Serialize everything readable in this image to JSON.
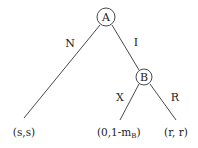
{
  "diagram": {
    "type": "game-tree",
    "nodes": [
      {
        "id": "A",
        "label": "A",
        "cx": 106,
        "cy": 18,
        "r": 9
      },
      {
        "id": "B",
        "label": "B",
        "cx": 144,
        "cy": 77,
        "r": 8
      }
    ],
    "edges": [
      {
        "from": "A",
        "label": "N",
        "to": "leaf-ss"
      },
      {
        "from": "A",
        "label": "I",
        "to": "B"
      },
      {
        "from": "B",
        "label": "X",
        "to": "leaf-0-1mb"
      },
      {
        "from": "B",
        "label": "R",
        "to": "leaf-rr"
      }
    ],
    "edge_labels": {
      "N": "N",
      "I": "I",
      "X": "X",
      "R": "R"
    },
    "payoffs": {
      "ss": "(s,s)",
      "zero_one_minus_mb_main": "(0,1-m",
      "zero_one_minus_mb_sub": "B",
      "zero_one_minus_mb_close": ")",
      "rr": "(r, r)"
    },
    "colors": {
      "line": "#333333",
      "text": "#222222",
      "background": "#ffffff"
    }
  }
}
